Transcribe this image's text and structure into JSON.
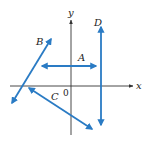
{
  "diagram": {
    "title": "",
    "axes": {
      "x_label": "x",
      "y_label": "y",
      "origin_label": "0",
      "color": "#333333"
    },
    "line_color": "#2a7bc4",
    "lines": [
      {
        "label": "A",
        "orientation": "horizontal",
        "x1": 42,
        "y1": 66,
        "x2": 96,
        "y2": 66,
        "label_x": 78,
        "label_y": 61
      },
      {
        "label": "B",
        "orientation": "positive-slope",
        "x1": 12,
        "y1": 103,
        "x2": 51,
        "y2": 39,
        "label_x": 36,
        "label_y": 45
      },
      {
        "label": "C",
        "orientation": "negative-slope",
        "x1": 29,
        "y1": 88,
        "x2": 92,
        "y2": 129,
        "label_x": 51,
        "label_y": 100
      },
      {
        "label": "D",
        "orientation": "vertical",
        "x1": 101,
        "y1": 27,
        "x2": 101,
        "y2": 125,
        "label_x": 94,
        "label_y": 26
      }
    ]
  }
}
